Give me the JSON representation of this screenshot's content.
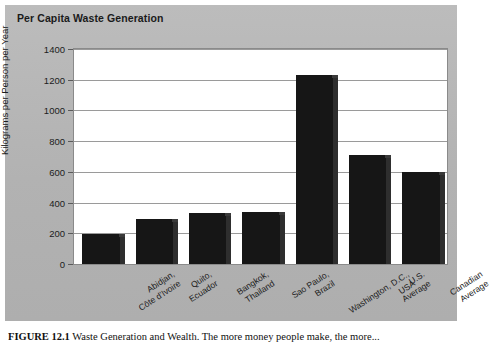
{
  "figure": {
    "title": "Per Capita Waste Generation",
    "caption_label": "FIGURE 12.1",
    "caption_text": "Waste Generation and Wealth. The more money people make, the more..."
  },
  "chart_data": {
    "type": "bar",
    "title": "Per Capita Waste Generation",
    "xlabel": "",
    "ylabel": "Kilograms per Person per Year",
    "ylim": [
      0,
      1400
    ],
    "ytick_step": 200,
    "yticks": [
      "0",
      "200",
      "400",
      "600",
      "800",
      "1000",
      "1200",
      "1400"
    ],
    "grid": true,
    "legend": "none",
    "bar_color": "#161616",
    "plot_background": "#ffffff",
    "panel_background": "#b4b4b4",
    "categories": [
      "Abidjan,\nCôte d'Ivoire",
      "Quito,\nEcuador",
      "Bangkok,\nThailand",
      "Sao Paulo,\nBrazil",
      "Washington, D.C.,\nUSA",
      "U.S.\nAverage",
      "Canadian\nAverage"
    ],
    "category_lines": [
      [
        "Abidjan,",
        "Côte d'Ivoire"
      ],
      [
        "Quito,",
        "Ecuador"
      ],
      [
        "Bangkok,",
        "Thailand"
      ],
      [
        "Sao Paulo,",
        "Brazil"
      ],
      [
        "Washington, D.C.,",
        "USA"
      ],
      [
        "U.S.",
        "Average"
      ],
      [
        "Canadian",
        "Average"
      ]
    ],
    "values": [
      195,
      295,
      330,
      340,
      1230,
      710,
      600
    ]
  }
}
